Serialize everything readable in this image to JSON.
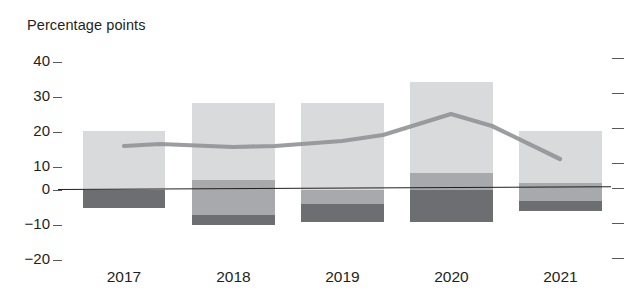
{
  "chart_data": {
    "type": "bar",
    "title": "",
    "subtitle": "",
    "ylabel": "Percentage points",
    "xlabel": "",
    "categories": [
      "2017",
      "2018",
      "2019",
      "2020",
      "2021"
    ],
    "ylim": [
      -20,
      40
    ],
    "yticks": [
      40,
      30,
      20,
      10,
      0,
      -10,
      -20
    ],
    "ytick_labels": [
      "40",
      "30",
      "20",
      "10",
      "0",
      "−10",
      "−20"
    ],
    "grid": false,
    "legend": "none",
    "stacked": true,
    "series": [
      {
        "name": "positive-contribution-light",
        "color": "#d9dadb",
        "values": [
          17,
          22,
          25,
          26,
          12
        ]
      },
      {
        "name": "mid-contribution-medium",
        "color": "#a7a9ac",
        "values": [
          0,
          3,
          -4,
          5,
          5
        ]
      },
      {
        "name": "negative-contribution-dark",
        "color": "#6d6e71",
        "values": [
          -5,
          -4,
          -5,
          -9,
          -3
        ]
      }
    ],
    "bar_totals": [
      12,
      21,
      16,
      22,
      14
    ],
    "overlay_line": {
      "name": "total-line",
      "color": "#939598",
      "type": "line",
      "x": [
        "2017",
        "2018",
        "2019",
        "2020",
        "2021"
      ],
      "values": [
        13,
        12.5,
        14,
        22,
        11
      ]
    },
    "bar_segments_px": [
      {
        "category": "2017",
        "light_top": 17,
        "light_bottom": 0,
        "mid_top": 0,
        "mid_bottom": 0,
        "dark_top": 0,
        "dark_bottom": -5
      },
      {
        "category": "2018",
        "light_top": 25,
        "light_bottom": 3,
        "mid_top": 3,
        "mid_bottom": -10,
        "dark_top": -7,
        "dark_bottom": -10
      },
      {
        "category": "2019",
        "light_top": 25,
        "light_bottom": 0,
        "mid_top": 0,
        "mid_bottom": -4,
        "dark_top": -4,
        "dark_bottom": -9
      },
      {
        "category": "2020",
        "light_top": 31,
        "light_bottom": 5,
        "mid_top": 5,
        "mid_bottom": 0,
        "dark_top": 0,
        "dark_bottom": -9
      },
      {
        "category": "2021",
        "light_top": 17,
        "light_bottom": 2,
        "mid_top": 2,
        "mid_bottom": -3,
        "dark_top": -3,
        "dark_bottom": -6
      }
    ]
  },
  "axis": {
    "title": "Percentage points",
    "y_ticks": [
      {
        "label": "40",
        "value": 40
      },
      {
        "label": "30",
        "value": 30
      },
      {
        "label": "20",
        "value": 20
      },
      {
        "label": "10",
        "value": 10
      },
      {
        "label": "0",
        "value": 0
      },
      {
        "label": "−10",
        "value": -10
      },
      {
        "label": "−20",
        "value": -20
      }
    ],
    "x_ticks": [
      "2017",
      "2018",
      "2019",
      "2020",
      "2021"
    ]
  },
  "colors": {
    "light_gray": "#d9dadb",
    "medium_gray": "#a7a9ac",
    "dark_gray": "#6d6e71",
    "line_gray": "#939598",
    "axis_black": "#231f20",
    "tick_gray": "#58595b",
    "background": "#ffffff"
  }
}
